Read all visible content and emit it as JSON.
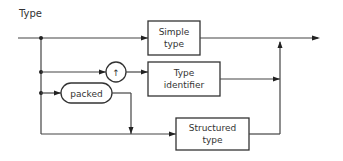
{
  "diagram": {
    "title": "Type",
    "nodes": {
      "simple_type": {
        "line1": "Simple",
        "line2": "type",
        "shape": "rectangle"
      },
      "pointer": {
        "label": "↑",
        "shape": "circle"
      },
      "type_identifier": {
        "line1": "Type",
        "line2": "identifier",
        "shape": "rectangle"
      },
      "packed": {
        "label": "packed",
        "shape": "rounded-terminal"
      },
      "structured_type": {
        "line1": "Structured",
        "line2": "type",
        "shape": "rectangle"
      }
    },
    "paths": [
      [
        "start",
        "simple_type",
        "end"
      ],
      [
        "start",
        "pointer",
        "type_identifier",
        "end"
      ],
      [
        "start",
        "packed",
        "structured_type",
        "end"
      ],
      [
        "start",
        "structured_type",
        "end"
      ]
    ],
    "colors": {
      "line": "#444444",
      "background": "#ffffff"
    }
  }
}
